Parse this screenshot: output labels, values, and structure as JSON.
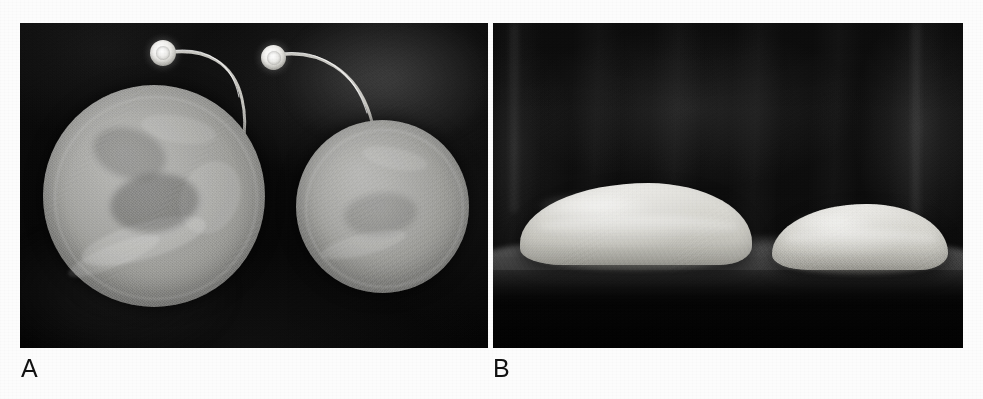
{
  "figure": {
    "type": "two-panel photographic figure",
    "background_color": "#fcfcfc",
    "width": 983,
    "height": 399
  },
  "panels": [
    {
      "id": "A",
      "label": "A",
      "view": "top-down (en face) view",
      "bounds": {
        "x": 20,
        "y": 23,
        "width": 468,
        "height": 325
      },
      "background_color": "#0a0a0a",
      "objects": [
        {
          "name": "large-implant-disc",
          "shape": "circle",
          "relative_size": "larger",
          "fill_color": "#9d9d99",
          "bounds": {
            "x": 23,
            "y": 62,
            "width": 222,
            "height": 222
          }
        },
        {
          "name": "small-implant-disc",
          "shape": "circle",
          "relative_size": "smaller",
          "fill_color": "#a3a39f",
          "bounds": {
            "x": 276,
            "y": 97,
            "width": 173,
            "height": 173
          }
        },
        {
          "name": "injection-port-left",
          "shape": "circle",
          "fill_color": "#f0efec",
          "bounds": {
            "x": 130,
            "y": 17,
            "width": 26,
            "height": 26
          }
        },
        {
          "name": "injection-port-right",
          "shape": "circle",
          "fill_color": "#f0efec",
          "bounds": {
            "x": 241,
            "y": 22,
            "width": 25,
            "height": 25
          }
        },
        {
          "name": "connector-tube-left",
          "shape": "curved tube",
          "stroke_color": "#d7d6d0"
        },
        {
          "name": "connector-tube-right",
          "shape": "curved tube",
          "stroke_color": "#d7d6d0"
        }
      ]
    },
    {
      "id": "B",
      "label": "B",
      "view": "lateral (profile) view",
      "bounds": {
        "x": 493,
        "y": 23,
        "width": 470,
        "height": 325
      },
      "background_color": "#0d0d0d",
      "objects": [
        {
          "name": "large-implant-dome",
          "shape": "low dome / teardrop profile",
          "relative_size": "larger",
          "fill_color": "#d6d5cf",
          "bounds": {
            "x": 27,
            "y": 160,
            "width": 232,
            "height": 82
          }
        },
        {
          "name": "small-implant-dome",
          "shape": "low dome / teardrop profile",
          "relative_size": "smaller",
          "fill_color": "#d6d5cf",
          "bounds": {
            "x": 279,
            "y": 181,
            "width": 176,
            "height": 66
          }
        },
        {
          "name": "support-surface-band",
          "shape": "horizontal pale band",
          "fill_color": "#8a8a8a"
        }
      ]
    }
  ],
  "labels": {
    "panel_a": "A",
    "panel_b": "B",
    "color": "#121212",
    "font_size_px": 25
  }
}
